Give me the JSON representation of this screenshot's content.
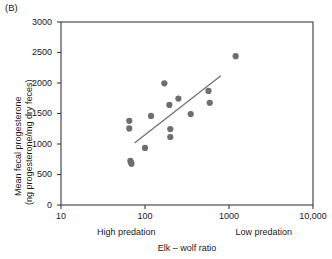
{
  "panel": {
    "label": "(B)"
  },
  "chart_data": {
    "type": "scatter",
    "title": "",
    "xlabel": "Elk – wolf ratio",
    "ylabel_line1": "Mean fecal progesterone",
    "ylabel_line2": "(ng progesterone/mg dry feces)",
    "xscale": "log",
    "yscale": "linear",
    "xlim": [
      10,
      10000
    ],
    "ylim": [
      0,
      3000
    ],
    "grid": false,
    "legend": null,
    "x_tick_labels": [
      "10",
      "100",
      "1000",
      "10,000"
    ],
    "x_tick_values": [
      10,
      100,
      1000,
      10000
    ],
    "y_tick_labels": [
      "0",
      "500",
      "1000",
      "1500",
      "2000",
      "2500",
      "3000"
    ],
    "y_tick_values": [
      0,
      500,
      1000,
      1500,
      2000,
      2500,
      3000
    ],
    "x_category_labels": [
      {
        "text": "High predation",
        "at": 60
      },
      {
        "text": "Low predation",
        "at": 2600
      }
    ],
    "marker_color": "#6e6e6e",
    "line_color": "#6e6e6e",
    "axis_color": "#3a3a3a",
    "points": [
      {
        "x": 65,
        "y": 1380
      },
      {
        "x": 65,
        "y": 1255
      },
      {
        "x": 67,
        "y": 725
      },
      {
        "x": 68,
        "y": 700
      },
      {
        "x": 69,
        "y": 675
      },
      {
        "x": 100,
        "y": 935
      },
      {
        "x": 118,
        "y": 1460
      },
      {
        "x": 170,
        "y": 1995
      },
      {
        "x": 195,
        "y": 1640
      },
      {
        "x": 200,
        "y": 1245
      },
      {
        "x": 200,
        "y": 1115
      },
      {
        "x": 250,
        "y": 1745
      },
      {
        "x": 350,
        "y": 1490
      },
      {
        "x": 570,
        "y": 1870
      },
      {
        "x": 590,
        "y": 1675
      },
      {
        "x": 1200,
        "y": 2440
      }
    ],
    "trendline": {
      "x1": 75,
      "y1": 1015,
      "x2": 800,
      "y2": 2120
    }
  }
}
